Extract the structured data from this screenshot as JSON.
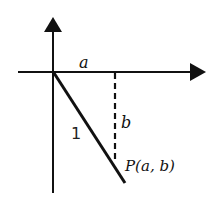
{
  "diagram": {
    "type": "unit-vector-coordinate-diagram",
    "labels": {
      "horizontal_segment": "a",
      "vertical_segment": "b",
      "hypotenuse": "1",
      "point": "P(a, b)"
    },
    "colors": {
      "stroke": "#111111",
      "background": "#ffffff"
    }
  }
}
